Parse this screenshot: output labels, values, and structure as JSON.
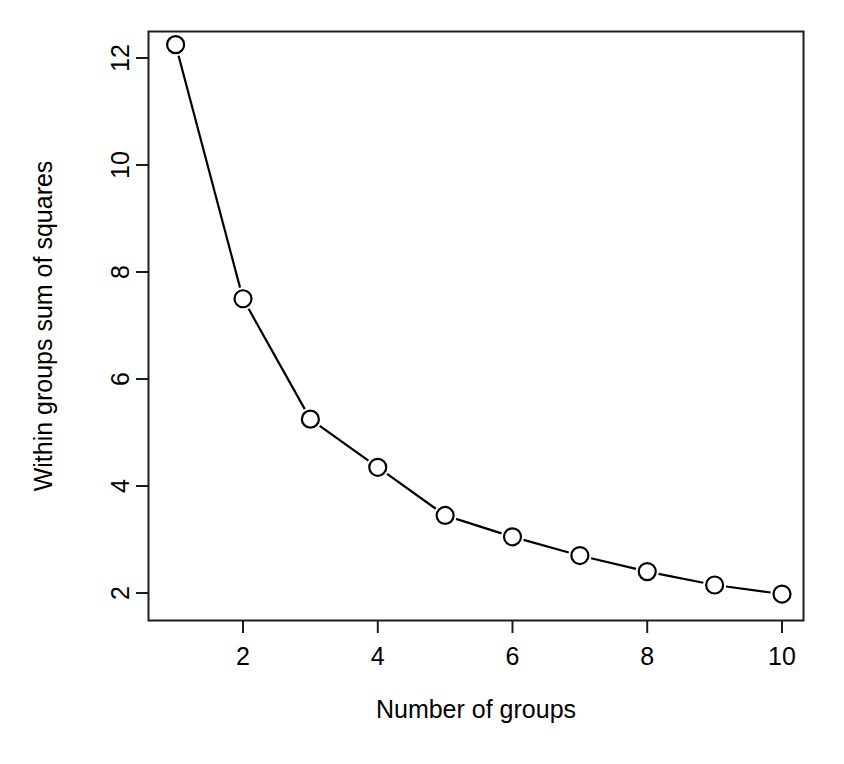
{
  "chart_data": {
    "type": "line",
    "title": "",
    "subtitle": "",
    "xlabel": "Number of groups",
    "ylabel": "Within groups sum of squares",
    "x": [
      1,
      2,
      3,
      4,
      5,
      6,
      7,
      8,
      9,
      10
    ],
    "values": [
      12.25,
      7.5,
      5.25,
      4.35,
      3.45,
      3.05,
      2.7,
      2.4,
      2.15,
      1.98
    ],
    "series": [
      {
        "name": "Within groups sum of squares",
        "values": [
          12.25,
          7.5,
          5.25,
          4.35,
          3.45,
          3.05,
          2.7,
          2.4,
          2.15,
          1.98
        ]
      }
    ],
    "xlim": [
      0.55,
      10.45
    ],
    "ylim": [
      1.73,
      12.5
    ],
    "xticks": [
      2,
      4,
      6,
      8,
      10
    ],
    "yticks": [
      2,
      4,
      6,
      8,
      10,
      12
    ],
    "xtick_labels": [
      "2",
      "4",
      "6",
      "8",
      "10"
    ],
    "ytick_labels": [
      "2",
      "4",
      "6",
      "8",
      "10",
      "12"
    ],
    "grid": false,
    "legend": false,
    "marker": "open-circle",
    "line_color": "#000000",
    "marker_color": "#000000",
    "background_color": "#ffffff",
    "box_border": true
  },
  "axes": {
    "x_title": "Number of groups",
    "y_title": "Within groups sum of squares",
    "x_tick_labels": [
      "2",
      "4",
      "6",
      "8",
      "10"
    ],
    "y_tick_labels": [
      "2",
      "4",
      "6",
      "8",
      "10",
      "12"
    ]
  },
  "colors": {
    "foreground": "#000000",
    "background": "#ffffff"
  }
}
